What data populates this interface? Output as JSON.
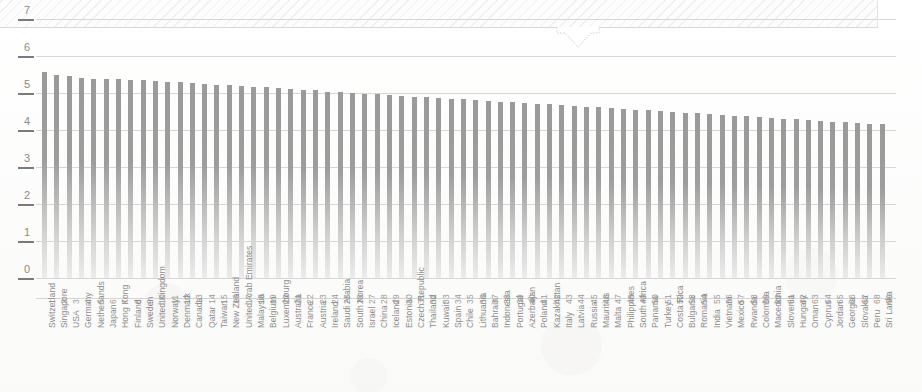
{
  "banner": {
    "name": "hatched-header-band",
    "pointer": "down-arrow-callout"
  },
  "chart_data": {
    "type": "bar",
    "title": "",
    "subtitle": "",
    "xlabel": "",
    "ylabel": "",
    "ylim": [
      0,
      7
    ],
    "yticks": [
      "0",
      "1",
      "2",
      "3",
      "4",
      "5",
      "6",
      "7"
    ],
    "grid": true,
    "legend": "none",
    "ranks": [
      1,
      2,
      3,
      4,
      5,
      6,
      7,
      8,
      9,
      10,
      11,
      12,
      13,
      14,
      15,
      16,
      17,
      18,
      19,
      20,
      21,
      22,
      23,
      24,
      25,
      26,
      27,
      28,
      29,
      30,
      31,
      32,
      33,
      34,
      35,
      36,
      37,
      38,
      39,
      40,
      41,
      42,
      43,
      44,
      45,
      46,
      47,
      48,
      49,
      50,
      51,
      52,
      53,
      54,
      55,
      56,
      57,
      58,
      59,
      60,
      61,
      62,
      63,
      64,
      65,
      66,
      67,
      68,
      69
    ],
    "categories": [
      "Switzerland",
      "Singapore",
      "USA",
      "Germany",
      "Netherlands",
      "Japan",
      "Hong Kong",
      "Finland",
      "Sweden",
      "United Kingdom",
      "Norway",
      "Denmark",
      "Canada",
      "Qatar",
      "Taiwan",
      "New Zealand",
      "United Arab Emirates",
      "Malaysia",
      "Belgium",
      "Luxembourg",
      "Australia",
      "France",
      "Austria",
      "Ireland",
      "Saudi Arabia",
      "South Korea",
      "Israel",
      "China",
      "Iceland",
      "Estonia",
      "Czech Republic",
      "Thailand",
      "Kuwait",
      "Spain",
      "Chile",
      "Lithuania",
      "Bahrain",
      "Indonesia",
      "Portugal",
      "Azerbaijan",
      "Poland",
      "Kazakhstan",
      "Italy",
      "Latvia",
      "Russia",
      "Mauritius",
      "Malta",
      "Philippines",
      "South Africa",
      "Panama",
      "Turkey",
      "Costa Rica",
      "Bulgaria",
      "Romania",
      "India",
      "Vietnam",
      "Mexico",
      "Rwanda",
      "Colombia",
      "Macedonia",
      "Slovenia",
      "Hungary",
      "Oman",
      "Cyprus",
      "Jordan",
      "Georgia",
      "Slovakia",
      "Peru",
      "Sri Lanka"
    ],
    "values": [
      5.56,
      5.49,
      5.46,
      5.41,
      5.39,
      5.38,
      5.37,
      5.35,
      5.34,
      5.33,
      5.31,
      5.29,
      5.27,
      5.25,
      5.23,
      5.21,
      5.19,
      5.17,
      5.15,
      5.13,
      5.11,
      5.09,
      5.07,
      5.04,
      5.02,
      5.0,
      4.98,
      4.96,
      4.94,
      4.92,
      4.9,
      4.88,
      4.86,
      4.85,
      4.83,
      4.81,
      4.79,
      4.77,
      4.75,
      4.73,
      4.71,
      4.69,
      4.67,
      4.65,
      4.63,
      4.61,
      4.59,
      4.57,
      4.55,
      4.53,
      4.51,
      4.49,
      4.47,
      4.45,
      4.43,
      4.41,
      4.39,
      4.37,
      4.35,
      4.33,
      4.31,
      4.29,
      4.27,
      4.25,
      4.23,
      4.21,
      4.19,
      4.17,
      4.15
    ]
  }
}
